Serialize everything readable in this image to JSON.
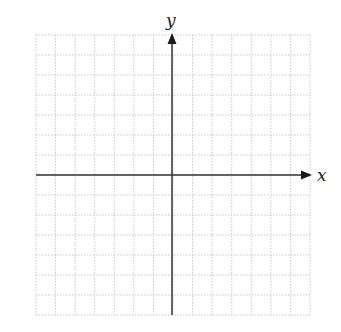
{
  "diagram": {
    "type": "coordinate-plane",
    "grid": {
      "columns": 14,
      "rows": 14,
      "left": 36,
      "right": 310,
      "top": 35,
      "bottom": 315,
      "line_color": "#c8c8c8",
      "line_style": "dotted"
    },
    "axes": {
      "origin_x": 172,
      "origin_y": 175,
      "color": "#333333",
      "x_axis": {
        "label": "x",
        "start": 36,
        "end": 312,
        "arrow": "right"
      },
      "y_axis": {
        "label": "y",
        "start": 315,
        "end": 33,
        "arrow": "up"
      }
    }
  }
}
